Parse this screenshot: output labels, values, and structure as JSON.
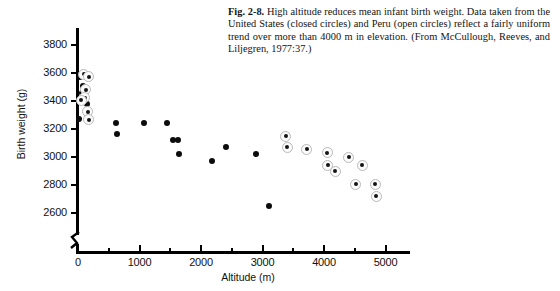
{
  "caption": {
    "label": "Fig. 2-8.",
    "text": " High altitude reduces mean infant birth weight. Data taken from the United States (closed circles) and Peru (open circles) reflect a fairly uniform trend over more than 4000 m in elevation. (From McCullough, Reeves, and Liljegren, 1977:37.)"
  },
  "axes": {
    "y_title": "Birth weight (g)",
    "x_title": "Altitude (m)",
    "y_ticks": [
      "2600",
      "2800",
      "3000",
      "3200",
      "3400",
      "3600",
      "3800"
    ],
    "x_ticks": [
      "0",
      "1000",
      "2000",
      "3000",
      "4000",
      "5000"
    ],
    "y_break": true
  },
  "colors": {
    "axis": "#000000",
    "closed_marker": "#0c0c0c",
    "open_marker_ring": "#b9b9b9",
    "open_marker_fill": "#fbfbfb",
    "text": "#111111"
  },
  "chart_data": {
    "type": "scatter",
    "title": "High altitude reduces mean infant birth weight",
    "xlabel": "Altitude (m)",
    "ylabel": "Birth weight (g)",
    "xlim": [
      0,
      5600
    ],
    "ylim": [
      2500,
      3870
    ],
    "grid": false,
    "legend": "in-caption",
    "y_axis_break_below": 2600,
    "series": [
      {
        "name": "United States (closed circles)",
        "marker": "closed-circle",
        "points": [
          {
            "x": 30,
            "y": 3570
          },
          {
            "x": 75,
            "y": 3510
          },
          {
            "x": 60,
            "y": 3455
          },
          {
            "x": 95,
            "y": 3395
          },
          {
            "x": 140,
            "y": 3380
          },
          {
            "x": 150,
            "y": 3320
          },
          {
            "x": 170,
            "y": 3310
          },
          {
            "x": 10,
            "y": 3275
          },
          {
            "x": 200,
            "y": 3265
          },
          {
            "x": 620,
            "y": 3240
          },
          {
            "x": 640,
            "y": 3165
          },
          {
            "x": 1080,
            "y": 3245
          },
          {
            "x": 1450,
            "y": 3245
          },
          {
            "x": 1550,
            "y": 3120
          },
          {
            "x": 1620,
            "y": 3120
          },
          {
            "x": 1640,
            "y": 3020
          },
          {
            "x": 2180,
            "y": 2975
          },
          {
            "x": 2400,
            "y": 3075
          },
          {
            "x": 2900,
            "y": 3020
          },
          {
            "x": 3100,
            "y": 2650
          }
        ]
      },
      {
        "name": "Peru (open circles)",
        "marker": "open-circle",
        "points": [
          {
            "x": 90,
            "y": 3590
          },
          {
            "x": 175,
            "y": 3575
          },
          {
            "x": 130,
            "y": 3480
          },
          {
            "x": 110,
            "y": 3425
          },
          {
            "x": 55,
            "y": 3405
          },
          {
            "x": 160,
            "y": 3325
          },
          {
            "x": 175,
            "y": 3265
          },
          {
            "x": 3380,
            "y": 3150
          },
          {
            "x": 3400,
            "y": 3070
          },
          {
            "x": 3720,
            "y": 3055
          },
          {
            "x": 4050,
            "y": 3030
          },
          {
            "x": 4060,
            "y": 2940
          },
          {
            "x": 4180,
            "y": 2900
          },
          {
            "x": 4400,
            "y": 3000
          },
          {
            "x": 4520,
            "y": 2805
          },
          {
            "x": 4830,
            "y": 2805
          },
          {
            "x": 4620,
            "y": 2940
          },
          {
            "x": 4850,
            "y": 2720
          }
        ]
      }
    ]
  }
}
